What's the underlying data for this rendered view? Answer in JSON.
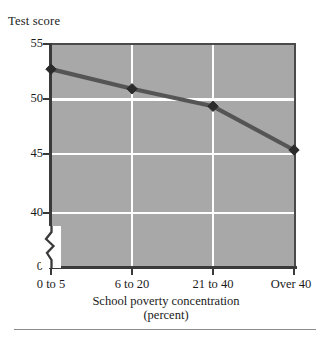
{
  "chart_data": {
    "type": "line",
    "title": "",
    "xlabel": "School poverty concentration",
    "xlabel_line2": "(percent)",
    "ylabel": "Test score",
    "categories": [
      "0 to 5",
      "6 to 20",
      "21 to 40",
      "Over 40"
    ],
    "values": [
      52.7,
      50.9,
      49.3,
      45.3
    ],
    "series": [
      {
        "name": "Test score",
        "values": [
          52.7,
          50.9,
          49.3,
          45.3
        ]
      }
    ],
    "ytick_labels": [
      "55",
      "50",
      "45",
      "40",
      "0"
    ],
    "ytick_values": [
      55,
      50,
      45,
      40,
      0
    ],
    "ylim": [
      40,
      55
    ],
    "axis_break": true,
    "axis_break_between": [
      0,
      40
    ],
    "grid": "both",
    "legend": "none",
    "marker": "diamond",
    "plot_background_color": "#a8a8a8",
    "gridline_color": "#ffffff",
    "line_color": "#555555",
    "marker_color": "#2b2b2b",
    "axis_color": "#3a3a3a"
  }
}
